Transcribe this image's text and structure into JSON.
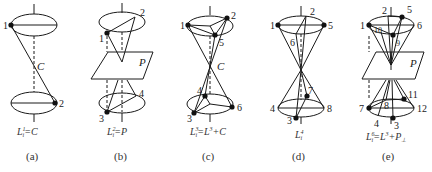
{
  "figure": {
    "panels": [
      {
        "id": "a",
        "caption": "(a)",
        "formula": {
          "base": "L",
          "sub": "i",
          "sup": "1",
          "rhs": "=C"
        },
        "center_label": "C",
        "points": [
          "1",
          "2"
        ]
      },
      {
        "id": "b",
        "caption": "(b)",
        "formula": {
          "base": "L",
          "sub": "i",
          "sup": "2",
          "rhs": "=P"
        },
        "plane_label": "P",
        "points": [
          "1",
          "2",
          "3",
          "4"
        ]
      },
      {
        "id": "c",
        "caption": "(c)",
        "formula": {
          "base": "L",
          "sub": "i",
          "sup": "3",
          "rhs": "=L",
          "rhs_sup": "3",
          "rhs_tail": "+C"
        },
        "center_label": "C",
        "points": [
          "1",
          "2",
          "3",
          "4",
          "5",
          "6"
        ]
      },
      {
        "id": "d",
        "caption": "(d)",
        "formula": {
          "base": "L",
          "sub": "i",
          "sup": "4",
          "rhs": ""
        },
        "points": [
          "1",
          "2",
          "3",
          "4",
          "5",
          "6",
          "7",
          "8"
        ]
      },
      {
        "id": "e",
        "caption": "(e)",
        "formula": {
          "base": "L",
          "sub": "i",
          "sup": "6",
          "rhs": "=L",
          "rhs_sup": "3",
          "rhs_tail": "+P",
          "rhs_tail_sub": "⊥"
        },
        "plane_label": "P",
        "points": [
          "1",
          "2",
          "3",
          "4",
          "5",
          "6",
          "7",
          "8",
          "9",
          "10",
          "11",
          "12"
        ]
      }
    ]
  }
}
